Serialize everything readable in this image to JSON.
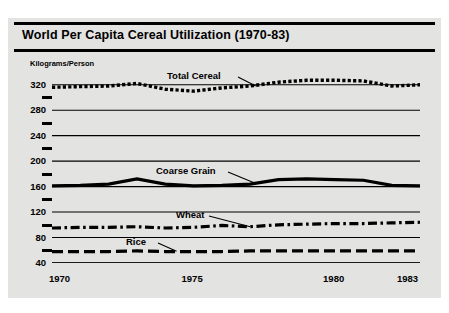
{
  "figure": {
    "title": "World Per Capita Cereal Utilization (1970-83)",
    "panel_color": "#e3e3e1",
    "ink_color": "#000000",
    "background_color": "#ffffff"
  },
  "chart_data": {
    "type": "line",
    "title": "World Per Capita Cereal Utilization (1970-83)",
    "xlabel": "",
    "ylabel": "Kilograms/Person",
    "grid": true,
    "legend_position": "inline-annotations",
    "xlim": [
      1970,
      1983
    ],
    "ylim": [
      40,
      340
    ],
    "x": [
      1970,
      1971,
      1972,
      1973,
      1974,
      1975,
      1976,
      1977,
      1978,
      1979,
      1980,
      1981,
      1982,
      1983
    ],
    "x_tick_labels": [
      "1970",
      "1975",
      "1980",
      "1983"
    ],
    "x_tick_label_values": [
      1970,
      1975,
      1980,
      1983
    ],
    "y_ticks": [
      40,
      80,
      120,
      160,
      200,
      240,
      280,
      320
    ],
    "y_minor_ticks": [
      60,
      100,
      140,
      180,
      220,
      260,
      300
    ],
    "series": [
      {
        "name": "Total Cereal",
        "style": "dotted",
        "values": [
          316,
          317,
          318,
          322,
          313,
          310,
          315,
          318,
          324,
          327,
          327,
          326,
          318,
          320
        ]
      },
      {
        "name": "Coarse Grain",
        "style": "solid",
        "values": [
          161,
          162,
          164,
          172,
          164,
          161,
          162,
          164,
          171,
          172,
          171,
          170,
          162,
          161
        ]
      },
      {
        "name": "Wheat",
        "style": "dash-dot",
        "values": [
          95,
          96,
          96,
          97,
          95,
          96,
          99,
          97,
          100,
          101,
          102,
          102,
          103,
          104
        ]
      },
      {
        "name": "Rice",
        "style": "dashed",
        "values": [
          58,
          58,
          58,
          59,
          58,
          58,
          58,
          59,
          59,
          59,
          59,
          59,
          59,
          59
        ]
      }
    ],
    "annotations": [
      {
        "text": "Total Cereal",
        "target_x": 1977,
        "target_y": 318
      },
      {
        "text": "Coarse Grain",
        "target_x": 1977,
        "target_y": 164
      },
      {
        "text": "Wheat",
        "target_x": 1977,
        "target_y": 97
      },
      {
        "text": "Rice",
        "target_x": 1974,
        "target_y": 58
      }
    ]
  }
}
